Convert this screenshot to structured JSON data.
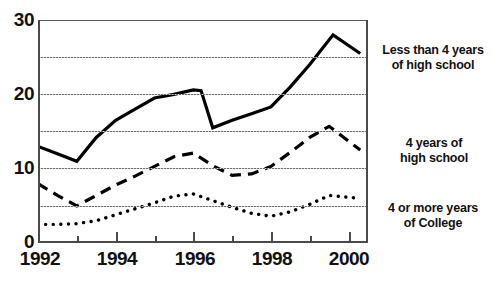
{
  "chart_data": {
    "type": "line",
    "title": "",
    "title_note": "cut off at top edge of scan",
    "xlabel": "",
    "ylabel": "",
    "xlim": [
      1992,
      2000.5
    ],
    "ylim": [
      0,
      30
    ],
    "grid": true,
    "gridlines_y": [
      5,
      10,
      15,
      20,
      25,
      30
    ],
    "ytick_labels": [
      "0",
      "10",
      "20",
      "30"
    ],
    "ytick_values": [
      0,
      10,
      20,
      30
    ],
    "xtick_labels": [
      "1992",
      "1994",
      "1996",
      "1998",
      "2000"
    ],
    "xtick_values": [
      1992,
      1994,
      1996,
      1998,
      2000
    ],
    "xtick_minor_values": [
      1993,
      1995,
      1997,
      1999
    ],
    "legend_position": "right-of-plot-at-series-end",
    "series": [
      {
        "name": "Less than 4 years\nof high school",
        "style": "solid",
        "x": [
          1992,
          1992.5,
          1993,
          1993.5,
          1994,
          1994.5,
          1995,
          1995.5,
          1996,
          1996.2,
          1996.5,
          1997,
          1997.5,
          1998,
          1998.5,
          1999,
          1999.6,
          2000.3
        ],
        "values": [
          13.0,
          12.0,
          11.0,
          14.2,
          16.5,
          18.0,
          19.5,
          20.0,
          20.6,
          20.5,
          15.5,
          16.5,
          17.4,
          18.3,
          21.0,
          24.0,
          28.0,
          25.5
        ]
      },
      {
        "name": "4 years of\nhigh school",
        "style": "dashed",
        "x": [
          1992,
          1992.5,
          1993,
          1993.5,
          1994,
          1994.5,
          1995,
          1995.5,
          1996,
          1996.5,
          1997,
          1997.5,
          1998,
          1998.5,
          1999,
          1999.5,
          2000.3
        ],
        "values": [
          8.0,
          6.4,
          5.0,
          6.4,
          7.8,
          9.0,
          10.3,
          11.6,
          12.1,
          10.4,
          9.1,
          9.3,
          10.3,
          12.2,
          14.2,
          15.7,
          12.5
        ]
      },
      {
        "name": "4 or more years\nof College",
        "style": "dotted",
        "x": [
          1992,
          1992.5,
          1993,
          1993.5,
          1994,
          1994.5,
          1995,
          1995.5,
          1996,
          1996.5,
          1997,
          1997.5,
          1998,
          1998.5,
          1999,
          1999.5,
          2000.3
        ],
        "values": [
          2.5,
          2.5,
          2.6,
          3.0,
          3.8,
          4.6,
          5.4,
          6.3,
          6.6,
          5.7,
          4.8,
          4.0,
          3.6,
          4.2,
          5.2,
          6.4,
          6.0
        ]
      }
    ]
  },
  "axis": {
    "y_labels": [
      "30",
      "20",
      "10",
      "0"
    ],
    "x_labels": [
      "1992",
      "1994",
      "1996",
      "1998",
      "2000"
    ]
  },
  "labels": {
    "series_0": "Less than 4 years\nof high school",
    "series_1": "4 years of\nhigh school",
    "series_2": "4 or more years\nof College"
  },
  "colors": {
    "ink": "#000000",
    "axis": "#4a4a4a",
    "grid": "#6e6e6e",
    "background": "#ffffff"
  }
}
